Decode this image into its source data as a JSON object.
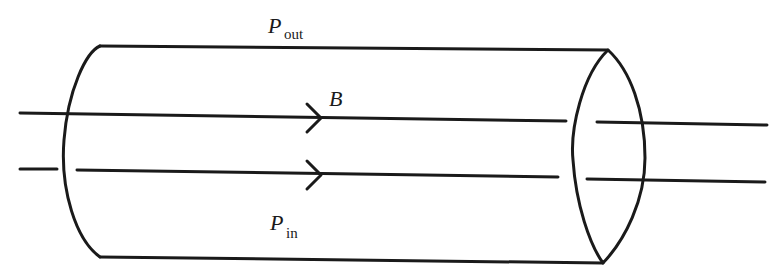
{
  "diagram": {
    "labels": {
      "p_out": {
        "symbol": "P",
        "subscript": "out"
      },
      "p_in": {
        "symbol": "P",
        "subscript": "in"
      },
      "field": {
        "symbol": "B"
      }
    },
    "shapes": {
      "tube": "cylinder",
      "field_lines": 2,
      "arrows": 2,
      "arrow_direction": "right"
    },
    "colors": {
      "stroke": "#1a1a1a",
      "background": "#ffffff"
    }
  }
}
